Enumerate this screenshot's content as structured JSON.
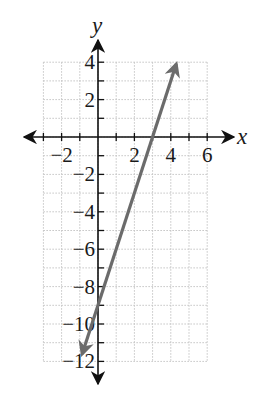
{
  "chart_data": {
    "type": "line",
    "title": "",
    "xlabel": "x",
    "ylabel": "y",
    "xlim": [
      -3,
      6
    ],
    "ylim": [
      -12,
      4
    ],
    "grid": true,
    "grid_step": 1,
    "x_ticks": [
      -2,
      2,
      4,
      6
    ],
    "x_tick_labels": [
      "−2",
      "2",
      "4",
      "6"
    ],
    "y_ticks": [
      4,
      2,
      -2,
      -4,
      -6,
      -8,
      -10,
      -12
    ],
    "y_tick_labels": [
      "4",
      "2",
      "−2",
      "−4",
      "−6",
      "−8",
      "−10",
      "−12"
    ],
    "series": [
      {
        "name": "y = 3x - 9",
        "equation": "y = 3x - 9",
        "slope": 3,
        "y_intercept": -9,
        "x_intercept": 3,
        "x": [
          -0.87,
          4.3
        ],
        "y": [
          -11.6,
          3.9
        ],
        "arrows": "both",
        "color": "#6b6b6b"
      }
    ]
  },
  "colors": {
    "line": "#6b6b6b",
    "grid": "#c4c4c4",
    "axis": "#111111"
  }
}
